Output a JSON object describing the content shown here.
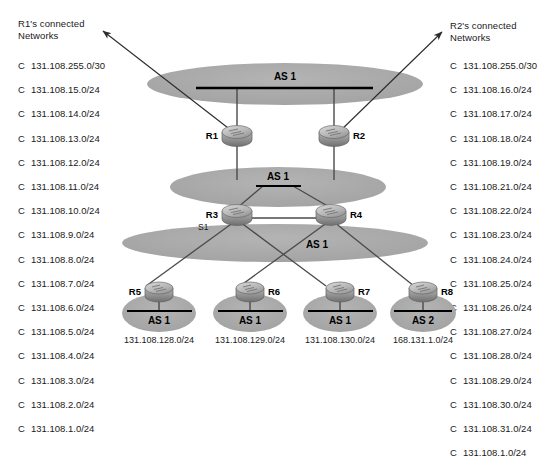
{
  "colors": {
    "cloud_fill": "#a9a9a9",
    "bus_line": "#000000",
    "link_line": "#4a4a4a",
    "router_body": "#9a9a9a",
    "router_top": "#c4c4c4",
    "text": "#1a1a1a",
    "background": "#ffffff"
  },
  "left_panel": {
    "title_line1": "R1's connected",
    "title_line2": "Networks",
    "routes": [
      {
        "code": "C",
        "network": "131.108.255.0/30"
      },
      {
        "code": "C",
        "network": "131.108.15.0/24"
      },
      {
        "code": "C",
        "network": "131.108.14.0/24"
      },
      {
        "code": "C",
        "network": "131.108.13.0/24"
      },
      {
        "code": "C",
        "network": "131.108.12.0/24"
      },
      {
        "code": "C",
        "network": "131.108.11.0/24"
      },
      {
        "code": "C",
        "network": "131.108.10.0/24"
      },
      {
        "code": "C",
        "network": "131.108.9.0/24"
      },
      {
        "code": "C",
        "network": "131.108.8.0/24"
      },
      {
        "code": "C",
        "network": "131.108.7.0/24"
      },
      {
        "code": "C",
        "network": "131.108.6.0/24"
      },
      {
        "code": "C",
        "network": "131.108.5.0/24"
      },
      {
        "code": "C",
        "network": "131.108.4.0/24"
      },
      {
        "code": "C",
        "network": "131.108.3.0/24"
      },
      {
        "code": "C",
        "network": "131.108.2.0/24"
      },
      {
        "code": "C",
        "network": "131.108.1.0/24"
      }
    ]
  },
  "right_panel": {
    "title_line1": "R2's connected",
    "title_line2": "Networks",
    "routes": [
      {
        "code": "C",
        "network": "131.108.255.0/30"
      },
      {
        "code": "C",
        "network": "131.108.16.0/24"
      },
      {
        "code": "C",
        "network": "131.108.17.0/24"
      },
      {
        "code": "C",
        "network": "131.108.18.0/24"
      },
      {
        "code": "C",
        "network": "131.108.19.0/24"
      },
      {
        "code": "C",
        "network": "131.108.21.0/24"
      },
      {
        "code": "C",
        "network": "131.108.22.0/24"
      },
      {
        "code": "C",
        "network": "131.108.23.0/24"
      },
      {
        "code": "C",
        "network": "131.108.24.0/24"
      },
      {
        "code": "C",
        "network": "131.108.25.0/24"
      },
      {
        "code": "C",
        "network": "131.108.26.0/24"
      },
      {
        "code": "C",
        "network": "131.108.27.0/24"
      },
      {
        "code": "C",
        "network": "131.108.28.0/24"
      },
      {
        "code": "C",
        "network": "131.108.29.0/24"
      },
      {
        "code": "C",
        "network": "131.108.30.0/24"
      },
      {
        "code": "C",
        "network": "131.108.31.0/24"
      },
      {
        "code": "C",
        "network": "131.108.1.0/24"
      }
    ]
  },
  "diagram": {
    "clouds": {
      "top": {
        "label": "AS 1"
      },
      "middle": {
        "label": "AS 1"
      },
      "bottom": {
        "label": "AS 1"
      },
      "leaf1": {
        "label": "AS 1",
        "network": "131.108.128.0/24"
      },
      "leaf2": {
        "label": "AS 1",
        "network": "131.108.129.0/24"
      },
      "leaf3": {
        "label": "AS 1",
        "network": "131.108.130.0/24"
      },
      "leaf4": {
        "label": "AS 2",
        "network": "168.131.1.0/24"
      }
    },
    "routers": {
      "r1": "R1",
      "r2": "R2",
      "r3": "R3",
      "r4": "R4",
      "r5": "R5",
      "r6": "R6",
      "r7": "R7",
      "r8": "R8"
    },
    "link_labels": {
      "s1": "S1"
    }
  }
}
